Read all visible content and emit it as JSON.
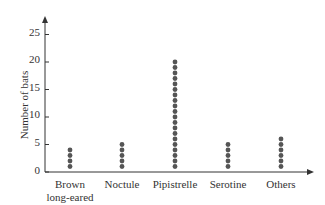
{
  "chart_data": {
    "type": "scatter",
    "subtype": "dot-plot",
    "title": "",
    "xlabel": "",
    "ylabel": "Number of bats",
    "categories": [
      "Brown long-eared",
      "Noctule",
      "Pipistrelle",
      "Serotine",
      "Others"
    ],
    "category_lines": [
      [
        "Brown",
        "long-eared"
      ],
      [
        "Noctule"
      ],
      [
        "Pipistrelle"
      ],
      [
        "Serotine"
      ],
      [
        "Others"
      ]
    ],
    "values": [
      4,
      5,
      20,
      5,
      6
    ],
    "yticks": [
      0,
      5,
      10,
      15,
      20,
      25
    ],
    "ylim": [
      0,
      27
    ],
    "grid": false,
    "legend": null,
    "dot_color": "#555555"
  },
  "axis": {
    "ylabel": "Number of bats",
    "ticks": [
      "0",
      "5",
      "10",
      "15",
      "20",
      "25"
    ]
  },
  "categories": {
    "c0_line1": "Brown",
    "c0_line2": "long-eared",
    "c1": "Noctule",
    "c2": "Pipistrelle",
    "c3": "Serotine",
    "c4": "Others"
  }
}
